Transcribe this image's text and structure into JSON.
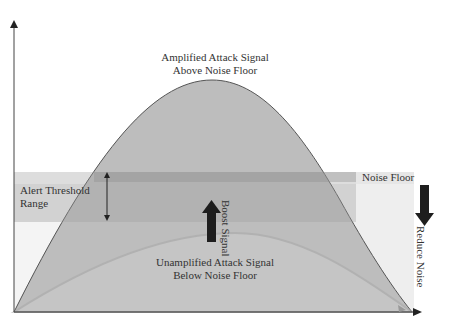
{
  "diagram": {
    "labels": {
      "amplified_line1": "Amplified Attack Signal",
      "amplified_line2": "Above Noise Floor",
      "alert_line1": "Alert Threshold",
      "alert_line2": "Range",
      "noise_floor": "Noise Floor",
      "boost_line1": "Boost",
      "boost_line2": "Signal",
      "reduce_line1": "Reduce",
      "reduce_line2": "Noise",
      "unamplified_line1": "Unamplified Attack Signal",
      "unamplified_line2": "Below Noise Floor"
    },
    "colors": {
      "amplified_fill": "#b9b9b9",
      "unamplified_fill": "#cfcfcf",
      "noise_band": "#e6e6e6",
      "alert_band": "#c8c8c8",
      "alert_top_band": "#b0b0b0",
      "arrow": "#1e1e1e",
      "axis": "#444444",
      "text": "#333333"
    }
  }
}
